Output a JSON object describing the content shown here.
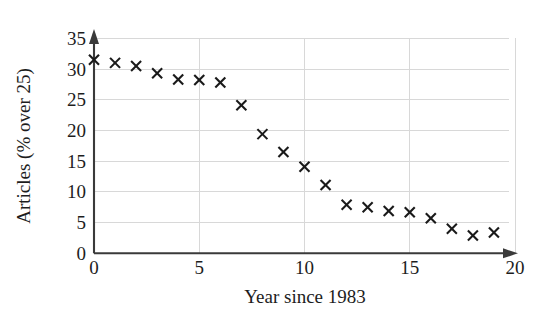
{
  "chart_data": {
    "type": "scatter",
    "title": "",
    "xlabel": "Year since 1983",
    "ylabel": "Articles (% over 25)",
    "xlim": [
      0,
      20
    ],
    "ylim": [
      0,
      35
    ],
    "grid": true,
    "legend": "none",
    "marker": "x",
    "marker_color": "#1a1a1a",
    "xticks": [
      0,
      5,
      10,
      15,
      20
    ],
    "xtick_labels": [
      "0",
      "5",
      "10",
      "15",
      "20"
    ],
    "yticks": [
      0,
      5,
      10,
      15,
      20,
      25,
      30,
      35
    ],
    "ytick_labels": [
      "0",
      "5",
      "10",
      "15",
      "20",
      "25",
      "30",
      "35"
    ],
    "x": [
      0,
      1,
      2,
      3,
      4,
      5,
      6,
      7,
      8,
      9,
      10,
      11,
      12,
      13,
      14,
      15,
      16,
      17,
      18,
      19
    ],
    "values": [
      31.5,
      31.0,
      30.5,
      29.3,
      28.3,
      28.2,
      27.8,
      24.1,
      19.4,
      16.5,
      14.1,
      11.1,
      7.9,
      7.5,
      6.9,
      6.7,
      5.7,
      4.0,
      2.9,
      3.4
    ],
    "series": [
      {
        "name": "Articles (% over 25)",
        "points": [
          [
            0,
            31.5
          ],
          [
            1,
            31.0
          ],
          [
            2,
            30.5
          ],
          [
            3,
            29.3
          ],
          [
            4,
            28.3
          ],
          [
            5,
            28.2
          ],
          [
            6,
            27.8
          ],
          [
            7,
            24.1
          ],
          [
            8,
            19.4
          ],
          [
            9,
            16.5
          ],
          [
            10,
            14.1
          ],
          [
            11,
            11.1
          ],
          [
            12,
            7.9
          ],
          [
            13,
            7.5
          ],
          [
            14,
            6.9
          ],
          [
            15,
            6.7
          ],
          [
            16,
            5.7
          ],
          [
            17,
            4.0
          ],
          [
            18,
            2.9
          ],
          [
            19,
            3.4
          ]
        ]
      }
    ]
  },
  "axes": {
    "x_title": "Year since 1983",
    "y_title": "Articles (% over 25)"
  },
  "colors": {
    "background": "#ffffff",
    "grid": "#d8d8d8",
    "axis": "#3a3a3a",
    "marker": "#1a1a1a",
    "text": "#1d1d1d"
  }
}
